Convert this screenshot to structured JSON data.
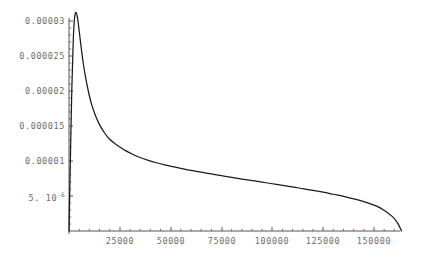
{
  "chart_data": {
    "type": "line",
    "title": "",
    "subtitle": "",
    "xlabel": "",
    "ylabel": "",
    "grid": false,
    "legend": null,
    "line_color": "#1a1a1a",
    "axis_color": "#555555",
    "tick_label_color": "#6b6b6b",
    "background": "#ffffff",
    "xlim": [
      0,
      175000
    ],
    "ylim": [
      0,
      3.2e-05
    ],
    "x_ticks": [
      25000,
      50000,
      75000,
      100000,
      125000,
      150000
    ],
    "x_tick_labels": [
      "25000",
      "50000",
      "75000",
      "100000",
      "125000",
      "150000"
    ],
    "x_minor_tick_step": 5000,
    "y_ticks": [
      5e-06,
      1e-05,
      1.5e-05,
      2e-05,
      2.5e-05,
      3e-05
    ],
    "y_tick_labels": [
      {
        "text": "5. 10",
        "exponent": "-6"
      },
      {
        "text": "0.00001",
        "exponent": ""
      },
      {
        "text": "0.000015",
        "exponent": ""
      },
      {
        "text": "0.00002",
        "exponent": ""
      },
      {
        "text": "0.000025",
        "exponent": ""
      },
      {
        "text": "0.00003",
        "exponent": ""
      }
    ],
    "series": [
      {
        "name": "density",
        "x": [
          0,
          700,
          1400,
          2100,
          2800,
          3500,
          4200,
          5000,
          6000,
          7000,
          8000,
          9500,
          11000,
          13000,
          15000,
          17500,
          20000,
          22500,
          25000,
          28000,
          31000,
          35000,
          39000,
          43000,
          47000,
          51000,
          55000,
          60000,
          65000,
          70000,
          75000,
          80000,
          85000,
          90000,
          95000,
          100000,
          105000,
          110000,
          115000,
          120000,
          125000,
          130000,
          135000,
          140000,
          145000,
          150000,
          153000,
          156000,
          158500,
          160500,
          162000,
          163000,
          163500
        ],
        "y": [
          0.0,
          1.05e-05,
          2.05e-05,
          2.73e-05,
          3.06e-05,
          3.12e-05,
          3.04e-05,
          2.86e-05,
          2.62e-05,
          2.4e-05,
          2.22e-05,
          2e-05,
          1.82e-05,
          1.65e-05,
          1.52e-05,
          1.4e-05,
          1.31e-05,
          1.25e-05,
          1.2e-05,
          1.145e-05,
          1.1e-05,
          1.05e-05,
          1.01e-05,
          9.75e-06,
          9.45e-06,
          9.2e-06,
          8.95e-06,
          8.65e-06,
          8.4e-06,
          8.15e-06,
          7.9e-06,
          7.65e-06,
          7.42e-06,
          7.2e-06,
          6.98e-06,
          6.75e-06,
          6.52e-06,
          6.3e-06,
          6.05e-06,
          5.8e-06,
          5.55e-06,
          5.25e-06,
          4.95e-06,
          4.6e-06,
          4.2e-06,
          3.7e-06,
          3.3e-06,
          2.75e-06,
          2.2e-06,
          1.6e-06,
          9.5e-07,
          3.5e-07,
          0.0
        ]
      }
    ],
    "annotations": []
  },
  "plot": {
    "geometry": {
      "axis_origin_x": 69,
      "axis_origin_y": 231,
      "y_axis_top": 18,
      "x_axis_right": 400,
      "x_tick_pixels": [
        120,
        171,
        222,
        272,
        323,
        374
      ],
      "y_tick_pixels": [
        196,
        161,
        126,
        91,
        56,
        21
      ]
    }
  }
}
